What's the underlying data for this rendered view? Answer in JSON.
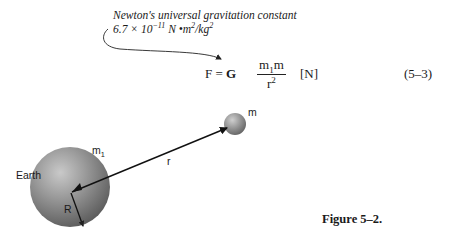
{
  "constant_note": {
    "title": "Newton's universal gravitation constant",
    "value_mantissa": "6.7 × 10",
    "value_exponent": "−11",
    "value_units_pre": " N •m",
    "value_units_exp1": "2",
    "value_units_mid": "/kg",
    "value_units_exp2": "2"
  },
  "equation": {
    "lhs": "F = ",
    "G": "G",
    "numerator_m1": "m",
    "numerator_m1_sub": "1",
    "numerator_m": "m",
    "denominator_r": "r",
    "denominator_exp": "2",
    "units": "[N]",
    "number": "(5–3)"
  },
  "diagram": {
    "earth_label": "Earth",
    "earth_mass_label": "m",
    "earth_mass_sub": "1",
    "object_mass_label": "m",
    "distance_label": "r",
    "radius_label": "R",
    "sphere_color": "#8a8a8a"
  },
  "figure": {
    "caption": "Figure 5–2."
  }
}
